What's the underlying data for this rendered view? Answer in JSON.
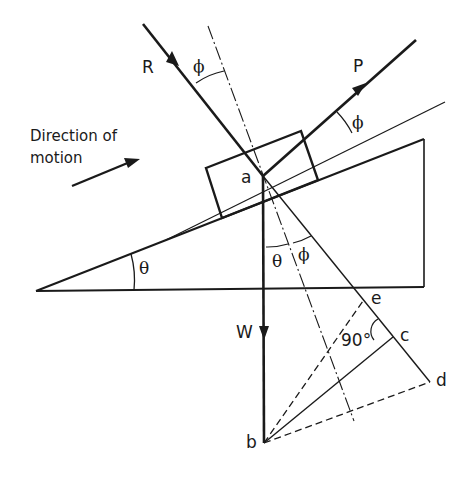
{
  "diagram": {
    "direction_label": {
      "line1": "Direction of",
      "line2": "motion"
    },
    "forces": {
      "R": "R",
      "P": "P",
      "W": "W"
    },
    "points": {
      "a": "a",
      "b": "b",
      "c": "c",
      "d": "d",
      "e": "e"
    },
    "angles": {
      "phi_R": "ϕ",
      "phi_P": "ϕ",
      "phi_bottom": "ϕ",
      "theta_bottom": "θ",
      "theta_incline": "θ",
      "right_angle": "90°"
    },
    "colors": {
      "ink": "#1a1a1a",
      "background": "#ffffff"
    }
  }
}
